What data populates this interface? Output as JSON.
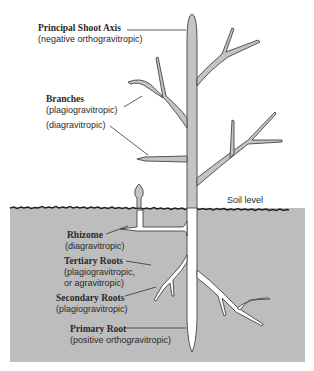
{
  "diagram": {
    "soil_label": "Soil level",
    "labels": {
      "principal_shoot": {
        "title": "Principal Shoot Axis",
        "sub": "(negative orthogravitropic)"
      },
      "branches": {
        "title": "Branches",
        "sub": "(plagiogravitropic)",
        "sub2": "(diagravitropic)"
      },
      "rhizome": {
        "title": "Rhizome",
        "sub": "(diagravitropic)"
      },
      "tertiary_roots": {
        "title": "Tertiary Roots",
        "sub": "(plagiogravitropic,",
        "sub2": "or agravitropic)"
      },
      "secondary_roots": {
        "title": "Secondary Roots",
        "sub": "(plagiogravitropic)"
      },
      "primary_root": {
        "title": "Primary Root",
        "sub": "(positive orthogravitropic)"
      }
    },
    "colors": {
      "soil": "#bdbdbd",
      "shoot": "#c4c4c4",
      "root": "#ffffff",
      "outline": "#444444"
    }
  }
}
